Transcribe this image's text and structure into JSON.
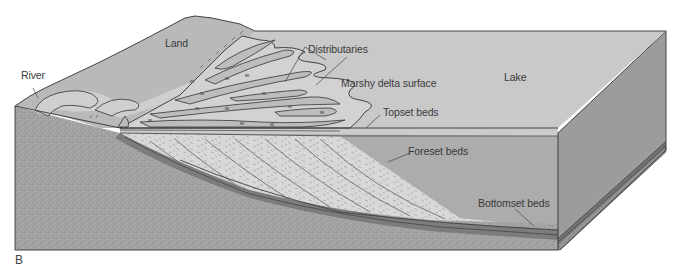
{
  "figure": {
    "panel_label": "B",
    "labels": {
      "land": "Land",
      "river": "River",
      "distributaries": "Distributaries",
      "marshy_delta_surface": "Marshy delta surface",
      "lake": "Lake",
      "topset_beds": "Topset beds",
      "foreset_beds": "Foreset beds",
      "bottomset_beds": "Bottomset beds"
    },
    "colors": {
      "land_surface": "#b7b7b7",
      "delta_surface": "#cfcfcf",
      "lake_top": "#c6c6c6",
      "lake_front": "#ababab",
      "lake_side": "#9a9a9a",
      "bedrock": "#a3a3a3",
      "foreset": "#d6d6d6",
      "bottomset": "#7e7e7e",
      "outline": "#333333"
    }
  }
}
